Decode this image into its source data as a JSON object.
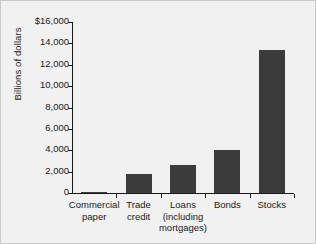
{
  "chart_data": {
    "type": "bar",
    "title": "",
    "subtitle": "",
    "xlabel": "",
    "ylabel": "Billions of dollars",
    "categories": [
      "Commercial\npaper",
      "Trade\ncredit",
      "Loans\n(including\nmortgages)",
      "Bonds",
      "Stocks"
    ],
    "values": [
      100,
      1750,
      2650,
      4000,
      13400
    ],
    "ylim": [
      0,
      16000
    ],
    "ytick_values": [
      0,
      2000,
      4000,
      6000,
      8000,
      10000,
      12000,
      14000,
      16000
    ],
    "ytick_labels": [
      "0",
      "2,000",
      "4,000",
      "6,000",
      "8,000",
      "10,000",
      "12,000",
      "14,000",
      "$16,000"
    ],
    "grid": false,
    "legend": null,
    "bar_color": "#3b3b3b",
    "axis_color": "#1a1a1a",
    "background_color": "#f1f1f1"
  }
}
